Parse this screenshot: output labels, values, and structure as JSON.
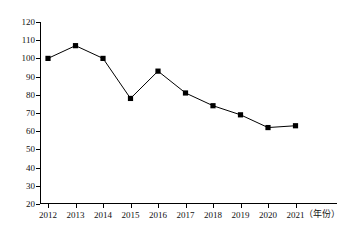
{
  "chart_data": {
    "type": "line",
    "title": "",
    "subtitle": "",
    "xlabel": "（年份）",
    "ylabel": "",
    "categories": [
      "2012",
      "2013",
      "2014",
      "2015",
      "2016",
      "2017",
      "2018",
      "2019",
      "2020",
      "2021"
    ],
    "values": [
      100,
      107,
      100,
      78,
      93,
      81,
      74,
      69,
      62,
      63
    ],
    "series": [
      {
        "name": "",
        "values": [
          100,
          107,
          100,
          78,
          93,
          81,
          74,
          69,
          62,
          63
        ]
      }
    ],
    "ylim": [
      20,
      120
    ],
    "yticks": [
      20,
      30,
      40,
      50,
      60,
      70,
      80,
      90,
      100,
      110,
      120
    ],
    "ytick_labels": [
      "20",
      "30",
      "40",
      "50",
      "60",
      "70",
      "80",
      "90",
      "100",
      "110",
      "120"
    ],
    "xlim_categories": [
      "2012",
      "2021"
    ],
    "grid": false,
    "legend": false,
    "legend_position": "none",
    "marker": "square",
    "marker_color": "#000000",
    "line_color": "#000000",
    "background_color": "#ffffff",
    "annotations": []
  }
}
